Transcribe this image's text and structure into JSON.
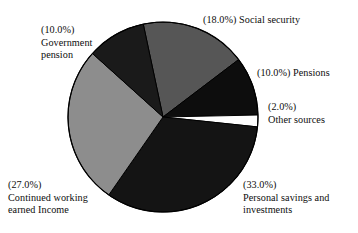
{
  "chart_data": {
    "type": "pie",
    "title": "",
    "subtitle": "",
    "xlabel": "",
    "ylabel": "",
    "legend_position": "none",
    "grid": false,
    "label_format": "(value%) name",
    "start_angle_deg": -12,
    "direction": "clockwise",
    "categories": [
      "Social security",
      "Pensions",
      "Other sources",
      "Personal savings and investments",
      "Continued working earned Income",
      "Government pension"
    ],
    "values": [
      18.0,
      10.0,
      2.0,
      33.0,
      27.0,
      10.0
    ],
    "value_labels": [
      "(18.0%)",
      "(10.0%)",
      "(2.0%)",
      "(33.0%)",
      "(27.0%)",
      "(10.0%)"
    ],
    "colors": [
      "#565656",
      "#0d0d0d",
      "#fdfdfd",
      "#141414",
      "#8d8d8d",
      "#1a1a1a"
    ],
    "slices": [
      {
        "name": "Social security",
        "value": 18.0,
        "value_label": "(18.0%)",
        "color": "#565656",
        "label_line1": "(18.0%) Social security",
        "label_line2": ""
      },
      {
        "name": "Pensions",
        "value": 10.0,
        "value_label": "(10.0%)",
        "color": "#0d0d0d",
        "label_line1": "(10.0%) Pensions",
        "label_line2": ""
      },
      {
        "name": "Other sources",
        "value": 2.0,
        "value_label": "(2.0%)",
        "color": "#fdfdfd",
        "label_line1": "(2.0%)",
        "label_line2": "Other sources"
      },
      {
        "name": "Personal savings and investments",
        "value": 33.0,
        "value_label": "(33.0%)",
        "color": "#141414",
        "label_line1": "(33.0%)",
        "label_line2": "Personal savings and",
        "label_line3": "investments"
      },
      {
        "name": "Continued working earned Income",
        "value": 27.0,
        "value_label": "(27.0%)",
        "color": "#8d8d8d",
        "label_line1": "(27.0%)",
        "label_line2": "Continued working",
        "label_line3": "earned Income"
      },
      {
        "name": "Government pension",
        "value": 10.0,
        "value_label": "(10.0%)",
        "color": "#1a1a1a",
        "label_line1": "(10.0%)",
        "label_line2": "Government",
        "label_line3": "pension"
      }
    ],
    "geometry": {
      "center_x": 163,
      "center_y": 117,
      "radius": 95,
      "outline_color": "#000000"
    }
  },
  "labels": {
    "social_security": {
      "line1": "(18.0%) Social security"
    },
    "pensions": {
      "line1": "(10.0%) Pensions"
    },
    "other_sources": {
      "line1": "(2.0%)",
      "line2": "Other sources"
    },
    "personal_savings": {
      "line1": "(33.0%)",
      "line2": "Personal savings and",
      "line3": "investments"
    },
    "continued_working": {
      "line1": "(27.0%)",
      "line2": "Continued working",
      "line3": "earned Income"
    },
    "government_pension": {
      "line1": "(10.0%)",
      "line2": "Government",
      "line3": "pension"
    }
  }
}
